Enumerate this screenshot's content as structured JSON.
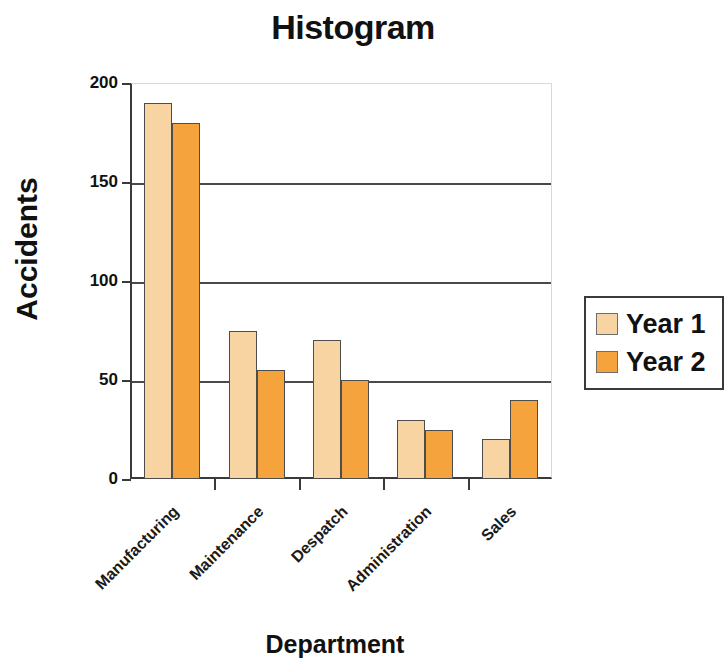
{
  "chart_data": {
    "type": "bar",
    "title": "Histogram",
    "xlabel": "Department",
    "ylabel": "Accidents",
    "categories": [
      "Manufacturing",
      "Maintenance",
      "Despatch",
      "Administration",
      "Sales"
    ],
    "series": [
      {
        "name": "Year 1",
        "color": "#f8d4a3",
        "values": [
          190,
          75,
          70,
          30,
          20
        ]
      },
      {
        "name": "Year 2",
        "color": "#f5a33c",
        "values": [
          180,
          55,
          50,
          25,
          40
        ]
      }
    ],
    "ylim": [
      0,
      200
    ],
    "yticks": [
      0,
      50,
      100,
      150,
      200
    ],
    "ytick_labels": [
      "0",
      "50",
      "100",
      "150",
      "200"
    ],
    "grid": "horizontal",
    "legend_position": "right",
    "legend_entries": [
      "Year 1",
      "Year 2"
    ],
    "xtick_label_rotation": 45
  }
}
